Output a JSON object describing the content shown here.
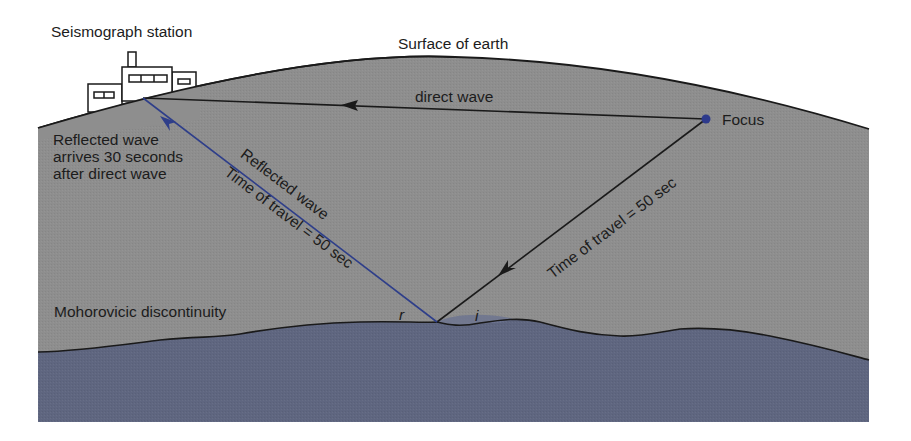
{
  "labels": {
    "station": "Seismograph station",
    "surface": "Surface of earth",
    "direct_wave": "direct wave",
    "focus": "Focus",
    "reflected_note": [
      "Reflected wave",
      "arrives 30 seconds",
      "after direct wave"
    ],
    "reflected_wave": "Reflected wave",
    "reflected_time": "Time of travel = 50 sec",
    "incident_time": "Time of travel = 50 sec",
    "moho": "Mohorovicic discontinuity",
    "angle_r": "r",
    "angle_i": "i"
  },
  "colors": {
    "crust": "#8e8e8e",
    "mantle": "#5f6680",
    "outline": "#1a1a1a",
    "reflected_ray": "#2e3e8a",
    "focus_dot": "#2d3a8c",
    "background": "#ffffff"
  },
  "geometry": {
    "station_point": [
      143,
      98
    ],
    "focus_point": [
      706,
      119
    ],
    "reflection_point": [
      437,
      322
    ]
  }
}
